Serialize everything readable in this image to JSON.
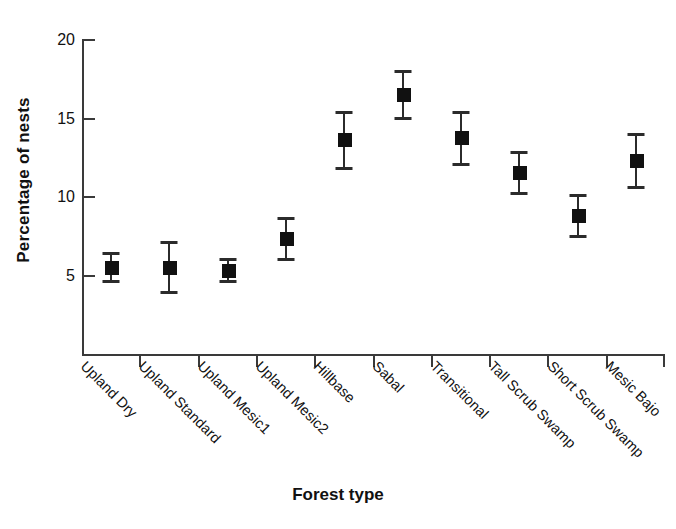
{
  "chart_data": {
    "type": "scatter",
    "title": "",
    "xlabel": "Forest type",
    "ylabel": "Percentage of nests",
    "ylim": [
      0,
      20
    ],
    "yticks": [
      5,
      10,
      15,
      20
    ],
    "grid": false,
    "legend": "none",
    "error_bars": "symmetric",
    "marker": "filled-square",
    "marker_color": "#111111",
    "categories": [
      "Upland Dry",
      "Upland Standard",
      "Upland Mesic1",
      "Upland Mesic2",
      "Hillbase",
      "Sabal",
      "Transitional",
      "Tall Scrub Swamp",
      "Short Scrub Swamp",
      "Mesic Bajo"
    ],
    "values": [
      5.5,
      5.5,
      5.3,
      7.3,
      13.6,
      16.5,
      13.75,
      11.5,
      8.8,
      12.3
    ],
    "errors": [
      1.0,
      1.7,
      0.8,
      1.4,
      1.85,
      1.6,
      1.75,
      1.4,
      1.4,
      1.8
    ],
    "points": [
      {
        "category": "Upland Dry",
        "value": 5.5,
        "err": 1.0,
        "low": 4.5,
        "high": 6.5
      },
      {
        "category": "Upland Standard",
        "value": 5.5,
        "err": 1.7,
        "low": 3.8,
        "high": 7.2
      },
      {
        "category": "Upland Mesic1",
        "value": 5.3,
        "err": 0.8,
        "low": 4.5,
        "high": 6.1
      },
      {
        "category": "Upland Mesic2",
        "value": 7.3,
        "err": 1.4,
        "low": 5.9,
        "high": 8.7
      },
      {
        "category": "Hillbase",
        "value": 13.6,
        "err": 1.85,
        "low": 11.75,
        "high": 15.45
      },
      {
        "category": "Sabal",
        "value": 16.5,
        "err": 1.6,
        "low": 14.9,
        "high": 18.1
      },
      {
        "category": "Transitional",
        "value": 13.75,
        "err": 1.75,
        "low": 12.0,
        "high": 15.5
      },
      {
        "category": "Tall Scrub Swamp",
        "value": 11.5,
        "err": 1.4,
        "low": 10.1,
        "high": 12.9
      },
      {
        "category": "Short Scrub Swamp",
        "value": 8.8,
        "err": 1.4,
        "low": 7.4,
        "high": 10.2
      },
      {
        "category": "Mesic Bajo",
        "value": 12.3,
        "err": 1.8,
        "low": 10.5,
        "high": 14.1
      }
    ]
  },
  "axes": {
    "y_label": "Percentage of nests",
    "x_label": "Forest type",
    "y_tick_labels": [
      "20",
      "15",
      "10",
      "5"
    ]
  }
}
